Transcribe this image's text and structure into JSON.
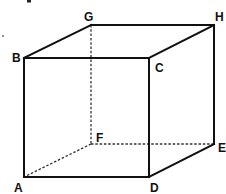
{
  "diagram": {
    "vertices": {
      "A": {
        "label": "A",
        "x": 24,
        "y": 177
      },
      "B": {
        "label": "B",
        "x": 24,
        "y": 58
      },
      "C": {
        "label": "C",
        "x": 149,
        "y": 58
      },
      "D": {
        "label": "D",
        "x": 149,
        "y": 177
      },
      "E": {
        "label": "E",
        "x": 214,
        "y": 144
      },
      "F": {
        "label": "F",
        "x": 91,
        "y": 144
      },
      "G": {
        "label": "G",
        "x": 91,
        "y": 25
      },
      "H": {
        "label": "H",
        "x": 214,
        "y": 25
      }
    },
    "visible_edges": [
      "AB",
      "BC",
      "CD",
      "DA",
      "BG",
      "GH",
      "HC",
      "HE",
      "ED"
    ],
    "hidden_edges": [
      "GF",
      "FA",
      "FE"
    ],
    "colors": {
      "stroke": "#111111",
      "hidden_stroke": "#333333",
      "background": "#ffffff"
    }
  }
}
